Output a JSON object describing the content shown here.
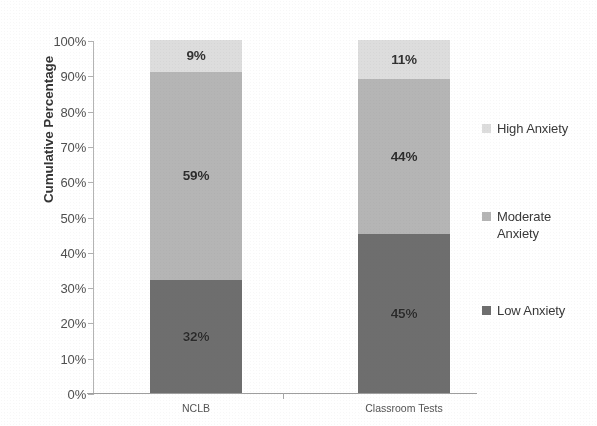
{
  "chart_data": {
    "type": "bar",
    "subtype": "stacked-bar-100-percent",
    "title": "",
    "xlabel": "",
    "ylabel": "Cumulative Percentage",
    "categories": [
      "NCLB",
      "Classroom Tests"
    ],
    "series": [
      {
        "name": "Low Anxiety",
        "values": [
          32,
          45
        ],
        "color": "#6b6b6b"
      },
      {
        "name": "Moderate Anxiety",
        "values": [
          59,
          44
        ],
        "color": "#b5b5b5"
      },
      {
        "name": "High Anxiety",
        "values": [
          9,
          11
        ],
        "color": "#dedede"
      }
    ],
    "data_labels": {
      "NCLB": {
        "Low Anxiety": "32%",
        "Moderate Anxiety": "59%",
        "High Anxiety": "9%"
      },
      "Classroom Tests": {
        "Low Anxiety": "45%",
        "Moderate Anxiety": "44%",
        "High Anxiety": "11%"
      }
    },
    "ylim": [
      0,
      100
    ],
    "ytick_values": [
      0,
      10,
      20,
      30,
      40,
      50,
      60,
      70,
      80,
      90,
      100
    ],
    "ytick_labels": [
      "0%",
      "10%",
      "20%",
      "30%",
      "40%",
      "50%",
      "60%",
      "70%",
      "80%",
      "90%",
      "100%"
    ],
    "grid": false,
    "legend_position": "right",
    "stack_order_bottom_to_top": [
      "Low Anxiety",
      "Moderate Anxiety",
      "High Anxiety"
    ]
  },
  "axis": {
    "y_title": "Cumulative Percentage",
    "ticks": [
      "100%",
      "90%",
      "80%",
      "70%",
      "60%",
      "50%",
      "40%",
      "30%",
      "20%",
      "10%",
      "0%"
    ]
  },
  "bars": [
    {
      "category": "NCLB",
      "segments": [
        {
          "name": "high",
          "label": "9%",
          "value": 9,
          "start": 91,
          "end": 100
        },
        {
          "name": "mod",
          "label": "59%",
          "value": 59,
          "start": 32,
          "end": 91
        },
        {
          "name": "low",
          "label": "32%",
          "value": 32,
          "start": 0,
          "end": 32
        }
      ]
    },
    {
      "category": "Classroom Tests",
      "segments": [
        {
          "name": "high",
          "label": "11%",
          "value": 11,
          "start": 89,
          "end": 100
        },
        {
          "name": "mod",
          "label": "44%",
          "value": 44,
          "start": 45,
          "end": 89
        },
        {
          "name": "low",
          "label": "45%",
          "value": 45,
          "start": 0,
          "end": 45
        }
      ]
    }
  ],
  "legend": {
    "items": [
      {
        "label": "High Anxiety",
        "color": "#dedede"
      },
      {
        "label": "Moderate\nAnxiety",
        "color": "#b5b5b5"
      },
      {
        "label": "Low Anxiety",
        "color": "#6b6b6b"
      }
    ]
  },
  "colors": {
    "low_anxiety": "#6b6b6b",
    "moderate_anxiety": "#b5b5b5",
    "high_anxiety": "#dedede",
    "axis": "#a8a8a8",
    "text": "#3a3a3a"
  }
}
